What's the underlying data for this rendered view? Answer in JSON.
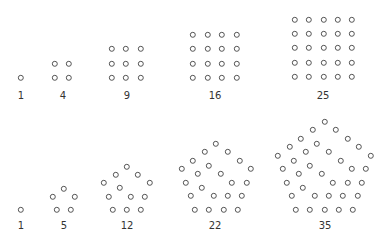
{
  "dot_color": "#555555",
  "label_color": "#333333",
  "rows": [
    {
      "name": "square-numbers",
      "figures": [
        {
          "label": "1",
          "kind": "square",
          "n": 1,
          "origin": [
            21,
            78
          ],
          "spacing": 14.3,
          "label_pos": [
            21,
            95
          ]
        },
        {
          "label": "4",
          "kind": "square",
          "n": 2,
          "origin": [
            55,
            78
          ],
          "spacing": 14.3,
          "label_pos": [
            63,
            95
          ]
        },
        {
          "label": "9",
          "kind": "square",
          "n": 3,
          "origin": [
            112,
            78
          ],
          "spacing": 14.3,
          "label_pos": [
            127,
            95
          ]
        },
        {
          "label": "16",
          "kind": "square",
          "n": 4,
          "origin": [
            193,
            78
          ],
          "spacing": 14.5,
          "label_pos": [
            215,
            95
          ]
        },
        {
          "label": "25",
          "kind": "square",
          "n": 5,
          "origin": [
            295,
            77
          ],
          "spacing": 14.3,
          "label_pos": [
            323,
            95
          ]
        }
      ]
    },
    {
      "name": "pentagonal-numbers",
      "figures": [
        {
          "label": "1",
          "kind": "pentagon",
          "n": 1,
          "origin": [
            21,
            210
          ],
          "spacing": 14.0,
          "label_pos": [
            21,
            225
          ]
        },
        {
          "label": "5",
          "kind": "pentagon",
          "n": 2,
          "origin": [
            57,
            210
          ],
          "spacing": 13.5,
          "label_pos": [
            64,
            225
          ]
        },
        {
          "label": "12",
          "kind": "pentagon",
          "n": 3,
          "origin": [
            113,
            210
          ],
          "spacing": 14.0,
          "label_pos": [
            127,
            225
          ]
        },
        {
          "label": "22",
          "kind": "pentagon",
          "n": 4,
          "origin": [
            195,
            210
          ],
          "spacing": 14.3,
          "label_pos": [
            215,
            225
          ]
        },
        {
          "label": "35",
          "kind": "pentagon",
          "n": 5,
          "origin": [
            296,
            210
          ],
          "spacing": 14.3,
          "label_pos": [
            325,
            225
          ]
        }
      ]
    }
  ],
  "chart_data": {
    "type": "scatter",
    "series": [
      {
        "name": "Square numbers",
        "n": [
          1,
          2,
          3,
          4,
          5
        ],
        "values": [
          1,
          4,
          9,
          16,
          25
        ]
      },
      {
        "name": "Pentagonal numbers",
        "n": [
          1,
          2,
          3,
          4,
          5
        ],
        "values": [
          1,
          5,
          12,
          22,
          35
        ]
      }
    ],
    "xlabel": "",
    "ylabel": "",
    "grid": false
  }
}
